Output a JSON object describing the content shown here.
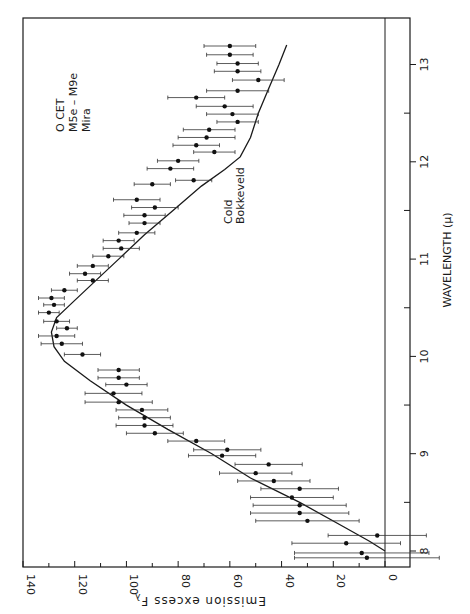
{
  "chart_data": {
    "type": "scatter",
    "orientation": "rotated-90-ccw",
    "title": "",
    "xlabel": "WAVELENGTH (μ)",
    "ylabel": "Emission excess Fλ",
    "xlim": [
      7.85,
      13.4
    ],
    "ylim": [
      -10,
      140
    ],
    "x_ticks": [
      8,
      9,
      10,
      11,
      12,
      13
    ],
    "x_minor_ticks": [
      8.5,
      9.5,
      10.5,
      11.5,
      12.5
    ],
    "y_ticks": [
      0,
      20,
      40,
      60,
      80,
      100,
      120,
      140
    ],
    "y_minor_ticks": [
      10,
      30,
      50,
      70,
      90,
      110,
      130
    ],
    "grid": false,
    "annotations": [
      {
        "text": "O CET",
        "x": 12.15,
        "y": 126
      },
      {
        "text": "M5e – M9e",
        "x": 12.15,
        "y": 121
      },
      {
        "text": "Mira",
        "x": 12.15,
        "y": 116
      },
      {
        "text": "Cold",
        "x": 11.05,
        "y": 62
      },
      {
        "text": "Bokkeveld",
        "x": 11.05,
        "y": 57
      }
    ],
    "series": [
      {
        "name": "O CET (M5e–M9e, Mira) observed emission excess",
        "kind": "points-with-x-error",
        "points": [
          {
            "x": 7.93,
            "y": 7,
            "err": 28
          },
          {
            "x": 7.98,
            "y": 9,
            "err": 26
          },
          {
            "x": 8.08,
            "y": 15,
            "err": 21
          },
          {
            "x": 8.16,
            "y": 3,
            "err": 19
          },
          {
            "x": 8.31,
            "y": 30,
            "err": 20
          },
          {
            "x": 8.39,
            "y": 33,
            "err": 19
          },
          {
            "x": 8.47,
            "y": 33,
            "err": 18
          },
          {
            "x": 8.55,
            "y": 36,
            "err": 16
          },
          {
            "x": 8.64,
            "y": 33,
            "err": 15
          },
          {
            "x": 8.72,
            "y": 43,
            "err": 14
          },
          {
            "x": 8.8,
            "y": 50,
            "err": 14
          },
          {
            "x": 8.89,
            "y": 45,
            "err": 13
          },
          {
            "x": 8.98,
            "y": 63,
            "err": 13
          },
          {
            "x": 9.04,
            "y": 61,
            "err": 13
          },
          {
            "x": 9.13,
            "y": 73,
            "err": 11
          },
          {
            "x": 9.21,
            "y": 89,
            "err": 11
          },
          {
            "x": 9.29,
            "y": 93,
            "err": 11
          },
          {
            "x": 9.37,
            "y": 93,
            "err": 10
          },
          {
            "x": 9.45,
            "y": 94,
            "err": 10
          },
          {
            "x": 9.53,
            "y": 103,
            "err": 13
          },
          {
            "x": 9.62,
            "y": 105,
            "err": 11
          },
          {
            "x": 9.71,
            "y": 100,
            "err": 8
          },
          {
            "x": 9.78,
            "y": 103,
            "err": 8
          },
          {
            "x": 9.86,
            "y": 103,
            "err": 8
          },
          {
            "x": 10.02,
            "y": 117,
            "err": 7
          },
          {
            "x": 10.13,
            "y": 125,
            "err": 8
          },
          {
            "x": 10.21,
            "y": 127,
            "err": 7
          },
          {
            "x": 10.29,
            "y": 123,
            "err": 4
          },
          {
            "x": 10.36,
            "y": 127,
            "err": 5
          },
          {
            "x": 10.45,
            "y": 130,
            "err": 4
          },
          {
            "x": 10.53,
            "y": 128,
            "err": 4
          },
          {
            "x": 10.6,
            "y": 129,
            "err": 5
          },
          {
            "x": 10.68,
            "y": 124,
            "err": 5
          },
          {
            "x": 10.78,
            "y": 113,
            "err": 6
          },
          {
            "x": 10.85,
            "y": 116,
            "err": 6
          },
          {
            "x": 10.93,
            "y": 113,
            "err": 6
          },
          {
            "x": 11.03,
            "y": 107,
            "err": 6
          },
          {
            "x": 11.11,
            "y": 102,
            "err": 7
          },
          {
            "x": 11.19,
            "y": 103,
            "err": 6
          },
          {
            "x": 11.27,
            "y": 96,
            "err": 7
          },
          {
            "x": 11.37,
            "y": 93,
            "err": 6
          },
          {
            "x": 11.45,
            "y": 93,
            "err": 8
          },
          {
            "x": 11.53,
            "y": 89,
            "err": 9
          },
          {
            "x": 11.61,
            "y": 96,
            "err": 9
          },
          {
            "x": 11.77,
            "y": 90,
            "err": 7
          },
          {
            "x": 11.81,
            "y": 74,
            "err": 7
          },
          {
            "x": 11.93,
            "y": 83,
            "err": 9
          },
          {
            "x": 12.01,
            "y": 80,
            "err": 8
          },
          {
            "x": 12.1,
            "y": 66,
            "err": 8
          },
          {
            "x": 12.17,
            "y": 73,
            "err": 9
          },
          {
            "x": 12.25,
            "y": 69,
            "err": 11
          },
          {
            "x": 12.33,
            "y": 68,
            "err": 10
          },
          {
            "x": 12.41,
            "y": 57,
            "err": 8
          },
          {
            "x": 12.49,
            "y": 59,
            "err": 10
          },
          {
            "x": 12.57,
            "y": 62,
            "err": 11
          },
          {
            "x": 12.66,
            "y": 73,
            "err": 11
          },
          {
            "x": 12.73,
            "y": 57,
            "err": 12
          },
          {
            "x": 12.84,
            "y": 49,
            "err": 10
          },
          {
            "x": 12.93,
            "y": 57,
            "err": 9
          },
          {
            "x": 13.01,
            "y": 57,
            "err": 8
          },
          {
            "x": 13.1,
            "y": 60,
            "err": 9
          },
          {
            "x": 13.19,
            "y": 60,
            "err": 10
          }
        ]
      },
      {
        "name": "Cold Bokkeveld (model curve)",
        "kind": "line",
        "points": [
          {
            "x": 8.0,
            "y": 0
          },
          {
            "x": 8.1,
            "y": 6
          },
          {
            "x": 8.25,
            "y": 16
          },
          {
            "x": 8.5,
            "y": 33
          },
          {
            "x": 8.75,
            "y": 52
          },
          {
            "x": 9.0,
            "y": 67
          },
          {
            "x": 9.25,
            "y": 84
          },
          {
            "x": 9.5,
            "y": 100
          },
          {
            "x": 9.75,
            "y": 114
          },
          {
            "x": 9.95,
            "y": 124
          },
          {
            "x": 10.1,
            "y": 128
          },
          {
            "x": 10.25,
            "y": 129
          },
          {
            "x": 10.4,
            "y": 127
          },
          {
            "x": 10.55,
            "y": 121
          },
          {
            "x": 10.75,
            "y": 113
          },
          {
            "x": 11.0,
            "y": 103
          },
          {
            "x": 11.25,
            "y": 93
          },
          {
            "x": 11.5,
            "y": 82
          },
          {
            "x": 11.75,
            "y": 71
          },
          {
            "x": 11.92,
            "y": 62
          },
          {
            "x": 12.05,
            "y": 56
          },
          {
            "x": 12.25,
            "y": 52
          },
          {
            "x": 12.5,
            "y": 49
          },
          {
            "x": 12.75,
            "y": 45
          },
          {
            "x": 13.0,
            "y": 41
          },
          {
            "x": 13.2,
            "y": 38
          }
        ]
      }
    ]
  },
  "labels": {
    "ylabel": "Emission excess F",
    "ylabel_sub": "λ",
    "xlabel": "WAVELENGTH (μ)",
    "star_name": "O CET",
    "star_type": "M5e – M9e",
    "star_class": "Mira",
    "model_line1": "Cold",
    "model_line2": "Bokkeveld"
  }
}
